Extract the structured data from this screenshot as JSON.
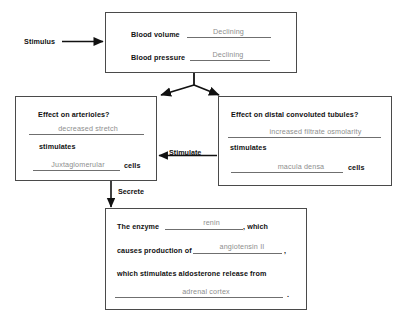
{
  "diagram": {
    "stimulus_label": "Stimulus",
    "top_box": {
      "row1_label": "Blood volume",
      "row1_answer": "Declining",
      "row2_label": "Blood pressure",
      "row2_answer": "Declining"
    },
    "left_box": {
      "question": "Effect on arterioles?",
      "answer1": "decreased stretch",
      "stimulates_label": "stimulates",
      "answer2": "Juxtaglomerular",
      "cells_label": "cells"
    },
    "right_box": {
      "question": "Effect on distal convoluted tubules?",
      "answer1": "increased filtrate osmolarity",
      "stimulates_label": "stimulates",
      "answer2": "macula densa",
      "cells_label": "cells"
    },
    "connector_stimulate": "Stimulate",
    "connector_secrete": "Secrete",
    "bottom_box": {
      "line1_prefix": "The enzyme",
      "line1_answer": "renin",
      "line1_suffix": ", which",
      "line2_prefix": "causes production of",
      "line2_answer": "angiotensin II",
      "line2_suffix": ",",
      "line3_text": "which stimulates aldosterone release from",
      "line4_answer": "adrenal cortex",
      "line4_suffix": "."
    },
    "colors": {
      "box_border": "#4a4a4a",
      "rule": "#6f6f6f",
      "answer_text": "#8e8e8e",
      "label_text": "#111111",
      "arrow": "#111111"
    }
  }
}
